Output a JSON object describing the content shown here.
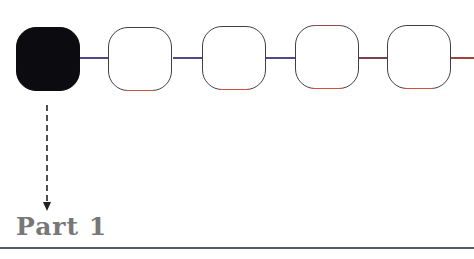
{
  "diagram": {
    "label": "Part 1",
    "nodes": [
      {
        "id": 1,
        "state": "active",
        "x": 16
      },
      {
        "id": 2,
        "state": "empty",
        "x": 108
      },
      {
        "id": 3,
        "state": "empty",
        "x": 202
      },
      {
        "id": 4,
        "state": "empty",
        "x": 295
      },
      {
        "id": 5,
        "state": "empty",
        "x": 387
      }
    ],
    "colors": {
      "active_fill": "#0b0b10",
      "node_border": "#3f3f4a",
      "connector_blue": "#4a4a8c",
      "connector_red": "#a0443a",
      "label": "#777777",
      "rule": "#555a68"
    }
  }
}
